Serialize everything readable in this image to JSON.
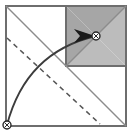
{
  "figure": {
    "title": "Square fold construction diagram",
    "canvas": {
      "width": 132,
      "height": 137,
      "background": "#ffffff"
    },
    "colors": {
      "outline": "#6e6e6e",
      "thin_line": "#8c8c8c",
      "shade_dark": "#a6a6a6",
      "shade_light": "#bcbcbc",
      "arc": "#3c3c3c",
      "arrow_fill": "#1a1a1a",
      "dash": "#555555",
      "marker_stroke": "#2a2a2a",
      "marker_fill": "#ffffff"
    },
    "shapes": {
      "outer_square": {
        "name": "outer-square",
        "x": 6,
        "y": 6,
        "width": 120,
        "height": 120
      },
      "shaded_square": {
        "name": "shaded-square",
        "x": 66,
        "y": 6,
        "width": 60,
        "height": 60
      },
      "main_diagonal": {
        "name": "main-diagonal",
        "x1": 6,
        "y1": 6,
        "x2": 126,
        "y2": 126
      },
      "anti_diagonal": {
        "name": "anti-diagonal",
        "x1": 66,
        "y1": 66,
        "x2": 126,
        "y2": 6
      },
      "shade_split_upper": {
        "name": "shade-split-upper",
        "points": "66,6 126,6 96,36"
      },
      "shade_split_left": {
        "name": "shade-split-left",
        "points": "66,6 66,66 96,36"
      },
      "shade_split_lower": {
        "name": "shade-split-lower",
        "points": "66,66 126,66 96,36"
      },
      "shade_split_right": {
        "name": "shade-split-right",
        "points": "126,6 126,66 96,36"
      }
    },
    "dashed_line": {
      "name": "dashed-crease",
      "x1": 7,
      "y1": 38,
      "x2": 100,
      "y2": 124,
      "dash_pattern": "5,4"
    },
    "arc": {
      "name": "rotation-arc",
      "start_x": 7,
      "start_y": 125,
      "end_x": 96,
      "end_y": 36,
      "control_x": 26,
      "control_y": 52
    },
    "arrow_head": {
      "name": "arrow-head",
      "points": "95,36 74,29 80,36 74,43",
      "tip_x": 96,
      "tip_y": 36
    },
    "markers": [
      {
        "name": "pivot-marker-origin",
        "cx": 7,
        "cy": 125,
        "r": 4,
        "crossed": true
      },
      {
        "name": "pivot-marker-target",
        "cx": 96,
        "cy": 36,
        "r": 4,
        "crossed": true
      }
    ],
    "labels": {
      "origin": "",
      "target": ""
    }
  }
}
